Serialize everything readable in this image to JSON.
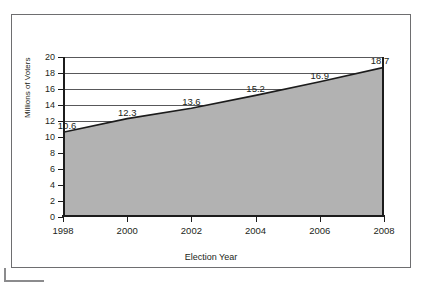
{
  "chart_data": {
    "type": "area",
    "title": "",
    "xlabel": "Election Year",
    "ylabel": "Millions of Voters",
    "x": [
      1998,
      2000,
      2002,
      2004,
      2006,
      2008
    ],
    "categories": [
      "1998",
      "2000",
      "2002",
      "2004",
      "2006",
      "2008"
    ],
    "values": [
      10.6,
      12.3,
      13.6,
      15.2,
      16.9,
      18.7
    ],
    "point_labels": [
      "10.6",
      "12.3",
      "13.6",
      "15.2",
      "16.9",
      "18.7"
    ],
    "xlim": [
      1998,
      2008
    ],
    "ylim": [
      0,
      20
    ],
    "y_ticks": [
      0,
      2,
      4,
      6,
      8,
      10,
      12,
      14,
      16,
      18,
      20
    ],
    "y_tick_labels": [
      "0",
      "2",
      "4",
      "6",
      "8",
      "10",
      "12",
      "14",
      "16",
      "18",
      "20"
    ],
    "x_ticks": [
      1998,
      2000,
      2002,
      2004,
      2006,
      2008
    ],
    "x_tick_labels": [
      "1998",
      "2000",
      "2002",
      "2004",
      "2006",
      "2008"
    ],
    "grid": "horizontal",
    "legend": "none",
    "series": [
      {
        "name": "Millions of Voters",
        "values": [
          10.6,
          12.3,
          13.6,
          15.2,
          16.9,
          18.7
        ],
        "fill_color": "#b2b2b2",
        "line_color": "#1c1c1c"
      }
    ]
  },
  "colors": {
    "area_fill": "#b2b2b2",
    "series_line": "#1c1c1c",
    "axis": "#1c1c1c",
    "gridline": "#58585a",
    "frame_border": "#6e6e70",
    "text": "#231f20",
    "background": "#ffffff"
  },
  "axes": {
    "y_title": "Millions of Voters",
    "x_title": "Election Year"
  }
}
